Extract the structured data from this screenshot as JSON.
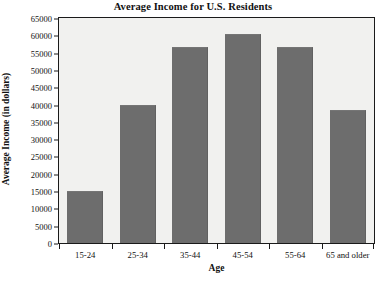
{
  "chart_data": {
    "type": "bar",
    "title": "Average Income for U.S. Residents",
    "xlabel": "Age",
    "ylabel": "Average Income (in dollars)",
    "categories": [
      "15-24",
      "25-34",
      "35-44",
      "45-54",
      "55-64",
      "65 and older"
    ],
    "values": [
      15000,
      40000,
      56500,
      60500,
      56500,
      38500
    ],
    "ylim": [
      0,
      65000
    ],
    "ytick_step": 5000,
    "yticks": [
      0,
      5000,
      10000,
      15000,
      20000,
      25000,
      30000,
      35000,
      40000,
      45000,
      50000,
      55000,
      60000,
      65000
    ],
    "ytick_labels": [
      "0",
      "5000",
      "10000",
      "15000",
      "20000",
      "25000",
      "30000",
      "35000",
      "40000",
      "45000",
      "50000",
      "55000",
      "60000",
      "65000"
    ],
    "grid": false,
    "legend": null,
    "bar_color": "#6d6d6d",
    "plot_background": "#f1f1ef",
    "axis_color": "#1a1a1a"
  }
}
